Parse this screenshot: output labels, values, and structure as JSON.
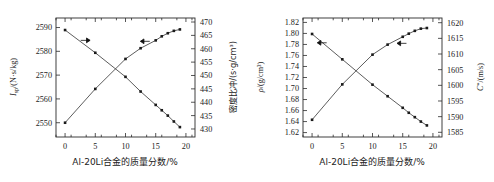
{
  "figure": {
    "panels": [
      {
        "id": "panel-left",
        "x_axis": {
          "label": "Al-20Li合金的质量分数/%",
          "ticks": [
            "0",
            "5",
            "10",
            "15",
            "20"
          ],
          "tick_values": [
            0,
            5,
            10,
            15,
            20
          ],
          "range": [
            -1.5,
            21.5
          ]
        },
        "y_axis_left": {
          "label_main": "I",
          "label_sub": "sp",
          "label_rest": "/(N·s/kg)",
          "label": "Isp/(N·s/kg)",
          "ticks": [
            "2550",
            "2560",
            "2570",
            "2580",
            "2590"
          ],
          "tick_values": [
            2550,
            2560,
            2570,
            2580,
            2590
          ],
          "range": [
            2544,
            2594
          ]
        },
        "y_axis_right": {
          "label": "密度比冲/(s·g/cm³)",
          "ticks": [
            "430",
            "435",
            "440",
            "445",
            "450",
            "455",
            "460",
            "465",
            "470"
          ],
          "tick_values": [
            430,
            435,
            440,
            445,
            450,
            455,
            460,
            465,
            470
          ],
          "range": [
            427,
            471.5
          ]
        },
        "arrows": [
          {
            "name": "arrow-to-right-axis",
            "direction": "right",
            "x": 3.4,
            "y_left": 2584.6
          },
          {
            "name": "arrow-to-left-axis",
            "direction": "left",
            "x": 13.2,
            "y_left": 2584.2
          }
        ]
      },
      {
        "id": "panel-right",
        "x_axis": {
          "label": "Al-20Li合金的质量分数/%",
          "ticks": [
            "0",
            "5",
            "10",
            "15",
            "20"
          ],
          "tick_values": [
            0,
            5,
            10,
            15,
            20
          ],
          "range": [
            -1.5,
            21.5
          ]
        },
        "y_axis_left": {
          "label_main": "ρ",
          "label_rest": "/(g/cm³)",
          "label": "ρ/(g/cm³)",
          "ticks": [
            "1.62",
            "1.64",
            "1.66",
            "1.68",
            "1.70",
            "1.72",
            "1.74",
            "1.76",
            "1.78",
            "1.80",
            "1.82"
          ],
          "tick_values": [
            1.62,
            1.64,
            1.66,
            1.68,
            1.7,
            1.72,
            1.74,
            1.76,
            1.78,
            1.8,
            1.82
          ],
          "range": [
            1.612,
            1.828
          ]
        },
        "y_axis_right": {
          "label_main": "C",
          "label_sup": "*",
          "label_rest": "/(m/s)",
          "label": "C*/(m/s)",
          "ticks": [
            "1585",
            "1590",
            "1595",
            "1600",
            "1605",
            "1610",
            "1615",
            "1620"
          ],
          "tick_values": [
            1585,
            1590,
            1595,
            1600,
            1605,
            1610,
            1615,
            1620
          ],
          "range": [
            1583.5,
            1621.5
          ]
        },
        "arrows": [
          {
            "name": "arrow-to-left-axis-upper",
            "direction": "left",
            "x": 1.6,
            "y_left": 1.783
          },
          {
            "name": "arrow-to-left-axis-rising",
            "direction": "left",
            "x": 14.8,
            "y_left": 1.782
          }
        ]
      }
    ]
  },
  "chart_data": [
    {
      "type": "line",
      "panel": "left",
      "title": "",
      "xlabel": "Al-20Li合金的质量分数/%",
      "ylabel": "Isp/(N·s/kg)",
      "ylabel_right": "密度比冲/(s·g/cm³)",
      "xlim": [
        -1.5,
        21.5
      ],
      "ylim": [
        2544,
        2594
      ],
      "ylim_right": [
        427,
        471.5
      ],
      "xticks": [
        0,
        5,
        10,
        15,
        20
      ],
      "yticks": [
        2550,
        2560,
        2570,
        2580,
        2590
      ],
      "yticks_right": [
        430,
        435,
        440,
        445,
        450,
        455,
        460,
        465,
        470
      ],
      "grid": false,
      "legend": "none",
      "series": [
        {
          "name": "密度比冲",
          "axis": "right",
          "marker": "square",
          "trend": "decreasing",
          "x": [
            0,
            5,
            10,
            12.5,
            15,
            16,
            17,
            18,
            19
          ],
          "values": [
            467.0,
            458.5,
            449.5,
            444.0,
            439.0,
            437.0,
            435.0,
            432.8,
            430.7
          ]
        },
        {
          "name": "Isp",
          "axis": "left",
          "marker": "square",
          "trend": "increasing",
          "x": [
            0,
            5,
            10,
            12.5,
            15,
            16,
            17,
            18,
            19
          ],
          "values": [
            2550.0,
            2564.2,
            2576.8,
            2581.3,
            2584.6,
            2586.3,
            2587.6,
            2588.6,
            2589.2
          ]
        }
      ]
    },
    {
      "type": "line",
      "panel": "right",
      "title": "",
      "xlabel": "Al-20Li合金的质量分数/%",
      "ylabel": "ρ/(g/cm³)",
      "ylabel_right": "C*/(m/s)",
      "xlim": [
        -1.5,
        21.5
      ],
      "ylim": [
        1.612,
        1.828
      ],
      "ylim_right": [
        1583.5,
        1621.5
      ],
      "xticks": [
        0,
        5,
        10,
        15,
        20
      ],
      "yticks": [
        1.62,
        1.64,
        1.66,
        1.68,
        1.7,
        1.72,
        1.74,
        1.76,
        1.78,
        1.8,
        1.82
      ],
      "yticks_right": [
        1585,
        1590,
        1595,
        1600,
        1605,
        1610,
        1615,
        1620
      ],
      "grid": false,
      "legend": "none",
      "series": [
        {
          "name": "ρ",
          "axis": "left",
          "marker": "square",
          "trend": "decreasing",
          "x": [
            0,
            5,
            10,
            12.5,
            15,
            16,
            17,
            18,
            19
          ],
          "values": [
            1.799,
            1.753,
            1.707,
            1.686,
            1.665,
            1.656,
            1.648,
            1.64,
            1.633
          ]
        },
        {
          "name": "C*",
          "axis": "right",
          "marker": "square",
          "trend": "increasing",
          "x": [
            0,
            5,
            10,
            12.5,
            15,
            16,
            17,
            18,
            19
          ],
          "values": [
            1589.0,
            1600.3,
            1609.8,
            1613.0,
            1615.5,
            1616.5,
            1617.4,
            1618.1,
            1618.3
          ]
        }
      ]
    }
  ]
}
